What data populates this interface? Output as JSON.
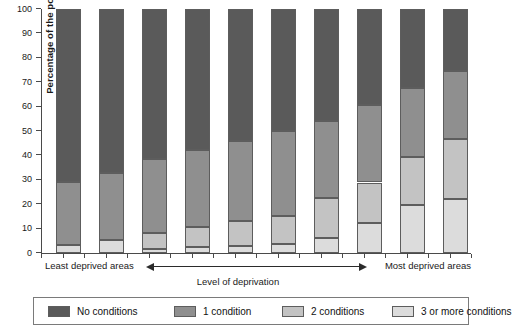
{
  "chart_data": {
    "type": "bar",
    "variant": "stacked-vertical-100",
    "title": "",
    "xlabel": "Level of deprivation",
    "ylabel": "Percentage of the population",
    "ylim": [
      0,
      100
    ],
    "ytick_step": 10,
    "grid": false,
    "legend_position": "bottom",
    "categories": [
      "1",
      "2",
      "3",
      "4",
      "5",
      "6",
      "7",
      "8",
      "9",
      "10"
    ],
    "x_axis_annotations": {
      "left": "Least deprived areas",
      "right": "Most deprived areas",
      "caption": "Level of deprivation",
      "arrow": "double-headed"
    },
    "yticks": [
      0,
      10,
      20,
      30,
      40,
      50,
      60,
      70,
      80,
      90,
      100
    ],
    "series": [
      {
        "name": "3 or more conditions",
        "color": "#dcdcdc",
        "values": [
          3.2,
          5.4,
          1.7,
          2.4,
          2.7,
          3.6,
          6.2,
          12.3,
          19.5,
          22.2
        ]
      },
      {
        "name": "2 conditions",
        "color": "#c3c3c3",
        "values": [
          0.0,
          0.0,
          6.5,
          8.1,
          10.5,
          11.4,
          16.4,
          16.6,
          19.9,
          24.5
        ]
      },
      {
        "name": "1 condition",
        "color": "#8f8f8f",
        "values": [
          25.8,
          27.3,
          30.3,
          31.8,
          32.6,
          35.0,
          31.6,
          31.8,
          28.4,
          28.0
        ]
      },
      {
        "name": "No conditions",
        "color": "#5a5a5a",
        "values": [
          71.0,
          67.3,
          61.5,
          57.7,
          54.2,
          50.0,
          45.8,
          39.3,
          32.2,
          25.3
        ]
      }
    ],
    "cumulative_tops": {
      "3 or more conditions": [
        3.2,
        5.4,
        1.7,
        2.4,
        2.7,
        3.6,
        6.2,
        12.3,
        19.5,
        22.2
      ],
      "2 conditions": [
        3.2,
        5.4,
        8.2,
        10.5,
        13.2,
        15.0,
        22.6,
        28.9,
        39.4,
        46.7
      ],
      "1 condition": [
        29.0,
        32.7,
        38.5,
        42.3,
        45.8,
        50.0,
        54.2,
        60.7,
        67.8,
        74.7
      ],
      "No conditions": [
        100,
        100,
        100,
        100,
        100,
        100,
        100,
        100,
        100,
        100
      ]
    }
  },
  "legend": {
    "items": [
      {
        "label": "No conditions",
        "color": "#5a5a5a"
      },
      {
        "label": "1 condition",
        "color": "#8f8f8f"
      },
      {
        "label": "2 conditions",
        "color": "#c3c3c3"
      },
      {
        "label": "3 or more conditions",
        "color": "#dcdcdc"
      }
    ]
  }
}
